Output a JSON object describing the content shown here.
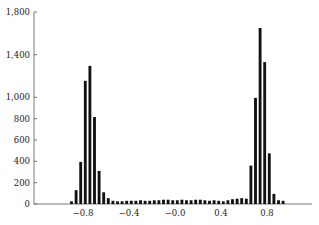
{
  "chart_data": {
    "type": "bar",
    "subtype": "histogram",
    "title": "",
    "xlabel": "",
    "ylabel": "",
    "bin_width": 0.04,
    "x": [
      -0.9,
      -0.86,
      -0.82,
      -0.78,
      -0.74,
      -0.7,
      -0.66,
      -0.62,
      -0.58,
      -0.54,
      -0.5,
      -0.46,
      -0.42,
      -0.38,
      -0.34,
      -0.3,
      -0.26,
      -0.22,
      -0.18,
      -0.14,
      -0.1,
      -0.06,
      -0.02,
      0.02,
      0.06,
      0.1,
      0.14,
      0.18,
      0.22,
      0.26,
      0.3,
      0.34,
      0.38,
      0.42,
      0.46,
      0.5,
      0.54,
      0.58,
      0.62,
      0.66,
      0.7,
      0.74,
      0.78,
      0.82,
      0.86,
      0.9,
      0.94
    ],
    "values": [
      25,
      130,
      395,
      1155,
      1295,
      815,
      310,
      110,
      55,
      30,
      25,
      25,
      30,
      30,
      30,
      35,
      30,
      30,
      35,
      35,
      40,
      40,
      35,
      35,
      40,
      35,
      35,
      40,
      40,
      35,
      30,
      35,
      30,
      25,
      35,
      45,
      50,
      55,
      50,
      360,
      995,
      1650,
      1330,
      475,
      95,
      35,
      30
    ],
    "ylim": [
      0,
      1800
    ],
    "xlim": [
      -1.0,
      1.15
    ],
    "yticks": [
      0,
      200,
      400,
      600,
      800,
      1000,
      1400,
      1800
    ],
    "ytick_labels": [
      "0",
      "200",
      "400",
      "600",
      "800",
      "1,000",
      "1,400",
      "1,800"
    ],
    "xticks": [
      -0.8,
      -0.4,
      0.0,
      0.4,
      0.8
    ],
    "xtick_labels": [
      "−0.8",
      "−0.4",
      "−0.0",
      "0.4",
      "0.8"
    ],
    "grid": false,
    "legend": null,
    "bar_color": "#111111"
  }
}
